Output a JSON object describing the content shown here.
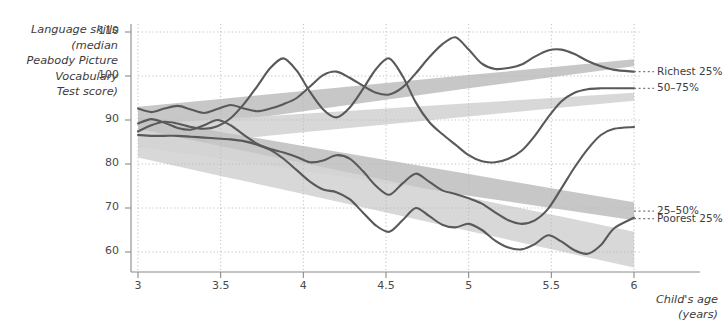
{
  "chart_data": {
    "type": "line",
    "title": "",
    "ylabel_lines": [
      "Language skills",
      "(median",
      "Peabody Picture",
      "Vocabulary",
      "Test score)"
    ],
    "xlabel_lines": [
      "Child's age",
      "(years)"
    ],
    "xlabel": "Child's age (years)",
    "ylabel": "Language skills (median Peabody Picture Vocabulary Test score)",
    "xlim": [
      3,
      6
    ],
    "ylim": [
      55,
      110
    ],
    "xticks": [
      3,
      3.5,
      4,
      4.5,
      5,
      5.5,
      6
    ],
    "xtick_labels": [
      "3",
      "3.5",
      "4",
      "4.5",
      "5",
      "5.5",
      "6"
    ],
    "yticks": [
      60,
      70,
      80,
      90,
      100,
      110
    ],
    "ytick_labels": [
      "60",
      "70",
      "80",
      "90",
      "100",
      "110"
    ],
    "grid": true,
    "legend_position": "right",
    "line_color": "#595959",
    "band_color": "#d5d5d5",
    "band_color_dark": "#c2c2c2",
    "background": "#ffffff",
    "legend": [
      {
        "label": "Richest 25%",
        "y_at_6": 101.0
      },
      {
        "label": "50–75%",
        "y_at_6": 97.2
      },
      {
        "label": "25–50%",
        "y_at_6": 69.3
      },
      {
        "label": "Poorest 25%",
        "y_at_6": 67.6
      }
    ],
    "bands": [
      {
        "name": "Richest 25%",
        "x": [
          3,
          3.5,
          4,
          4.5,
          5,
          5.5,
          6
        ],
        "lower": [
          86.5,
          89.3,
          92.0,
          94.6,
          97.2,
          99.7,
          102.2
        ],
        "upper": [
          93.0,
          94.8,
          96.6,
          98.4,
          100.2,
          102.0,
          103.8
        ]
      },
      {
        "name": "50–75%",
        "x": [
          3,
          3.5,
          4,
          4.5,
          5,
          5.5,
          6
        ],
        "lower": [
          83.4,
          85.3,
          87.2,
          89.0,
          90.8,
          92.6,
          94.4
        ],
        "upper": [
          89.0,
          90.2,
          91.4,
          92.6,
          93.8,
          95.0,
          96.2
        ]
      },
      {
        "name": "25–50%",
        "x": [
          3,
          3.5,
          4,
          4.5,
          5,
          5.5,
          6
        ],
        "lower": [
          84.0,
          81.2,
          78.4,
          75.6,
          72.8,
          70.0,
          67.2
        ],
        "upper": [
          90.5,
          87.3,
          84.1,
          80.9,
          77.7,
          74.5,
          71.3
        ]
      },
      {
        "name": "Poorest 25%",
        "x": [
          3,
          3.5,
          4,
          4.5,
          5,
          5.5,
          6
        ],
        "lower": [
          81.5,
          77.3,
          73.2,
          69.0,
          64.8,
          60.6,
          56.5
        ],
        "upper": [
          88.0,
          84.1,
          80.2,
          76.3,
          72.4,
          68.5,
          64.6
        ]
      }
    ],
    "series": [
      {
        "name": "Richest 25%",
        "x": [
          3.0,
          3.08,
          3.16,
          3.24,
          3.32,
          3.4,
          3.48,
          3.56,
          3.64,
          3.72,
          3.8,
          3.88,
          3.96,
          4.04,
          4.12,
          4.2,
          4.28,
          4.36,
          4.44,
          4.52,
          4.6,
          4.68,
          4.76,
          4.84,
          4.92,
          5.0,
          5.08,
          5.16,
          5.24,
          5.32,
          5.4,
          5.48,
          5.56,
          5.64,
          5.72,
          5.8,
          5.88,
          6.0
        ],
        "values": [
          92.6,
          91.8,
          92.6,
          93.2,
          92.4,
          91.6,
          92.5,
          93.4,
          92.6,
          92.0,
          92.6,
          93.6,
          95.0,
          97.6,
          100.2,
          101.0,
          99.6,
          97.8,
          96.2,
          95.8,
          97.4,
          100.6,
          104.2,
          107.2,
          108.8,
          106.0,
          102.8,
          101.6,
          101.8,
          102.6,
          104.4,
          105.8,
          106.0,
          105.0,
          103.4,
          102.2,
          101.4,
          101.0
        ]
      },
      {
        "name": "50–75%",
        "x": [
          3.0,
          3.08,
          3.16,
          3.24,
          3.32,
          3.4,
          3.48,
          3.56,
          3.64,
          3.72,
          3.8,
          3.88,
          3.96,
          4.04,
          4.12,
          4.2,
          4.28,
          4.36,
          4.44,
          4.52,
          4.6,
          4.68,
          4.76,
          4.84,
          4.92,
          5.0,
          5.08,
          5.16,
          5.24,
          5.32,
          5.4,
          5.48,
          5.56,
          5.64,
          5.72,
          5.8,
          5.88,
          6.0
        ],
        "values": [
          87.4,
          88.8,
          89.6,
          89.2,
          88.4,
          88.0,
          88.6,
          90.4,
          93.6,
          97.6,
          101.8,
          104.0,
          101.2,
          96.4,
          92.4,
          90.6,
          92.8,
          97.0,
          101.6,
          104.0,
          100.0,
          94.0,
          89.6,
          86.8,
          84.4,
          82.0,
          80.6,
          80.4,
          81.2,
          83.0,
          86.4,
          90.6,
          94.2,
          96.2,
          97.0,
          97.2,
          97.2,
          97.2
        ]
      },
      {
        "name": "25–50%",
        "x": [
          3.0,
          3.08,
          3.16,
          3.24,
          3.32,
          3.4,
          3.48,
          3.56,
          3.64,
          3.72,
          3.8,
          3.88,
          3.96,
          4.04,
          4.12,
          4.2,
          4.28,
          4.36,
          4.44,
          4.52,
          4.6,
          4.68,
          4.76,
          4.84,
          4.92,
          5.0,
          5.08,
          5.16,
          5.24,
          5.32,
          5.4,
          5.48,
          5.56,
          5.64,
          5.72,
          5.8,
          5.88,
          6.0
        ],
        "values": [
          89.2,
          90.2,
          89.4,
          88.2,
          87.8,
          88.8,
          90.0,
          88.8,
          86.6,
          84.6,
          83.4,
          82.6,
          81.6,
          80.4,
          80.8,
          82.0,
          81.2,
          78.4,
          75.0,
          73.0,
          75.6,
          77.8,
          76.0,
          74.0,
          73.2,
          72.2,
          71.0,
          69.0,
          67.2,
          66.4,
          67.2,
          69.8,
          74.4,
          79.2,
          83.4,
          86.6,
          88.0,
          88.4
        ]
      },
      {
        "name": "Poorest 25%",
        "x": [
          3.0,
          3.08,
          3.16,
          3.24,
          3.32,
          3.4,
          3.48,
          3.56,
          3.64,
          3.72,
          3.8,
          3.88,
          3.96,
          4.04,
          4.12,
          4.2,
          4.28,
          4.36,
          4.44,
          4.52,
          4.6,
          4.68,
          4.76,
          4.84,
          4.92,
          5.0,
          5.08,
          5.16,
          5.24,
          5.32,
          5.4,
          5.48,
          5.56,
          5.64,
          5.72,
          5.8,
          5.88,
          6.0
        ],
        "values": [
          86.6,
          86.4,
          86.4,
          86.4,
          86.2,
          86.0,
          85.8,
          85.6,
          85.2,
          84.4,
          83.2,
          81.2,
          78.6,
          76.0,
          74.2,
          73.6,
          72.0,
          69.0,
          66.0,
          64.6,
          67.2,
          70.0,
          68.2,
          66.2,
          65.6,
          66.4,
          65.0,
          62.6,
          61.0,
          60.6,
          61.8,
          63.8,
          62.4,
          60.4,
          59.6,
          61.6,
          65.4,
          67.8
        ]
      }
    ]
  }
}
